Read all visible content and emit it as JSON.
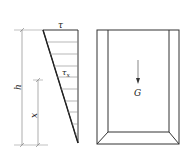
{
  "diagram": {
    "left_figure": {
      "description": "Triangular shear stress distribution along height",
      "labels": {
        "top_stress": "τ",
        "local_stress": "τ",
        "local_stress_subscript": "x",
        "height": "h",
        "position": "x"
      },
      "hatch_lines": 9
    },
    "right_figure": {
      "description": "Box/container in perspective with downward weight arrow",
      "labels": {
        "weight": "G"
      }
    },
    "colors": {
      "stroke": "#333333",
      "thin_stroke": "#777777",
      "background": "#ffffff"
    }
  }
}
